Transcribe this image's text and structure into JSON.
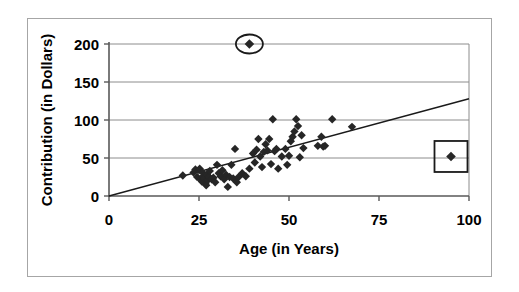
{
  "chart_data": {
    "type": "scatter",
    "title": "",
    "xlabel": "Age (in Years)",
    "ylabel": "Contribution (in Dollars)",
    "xlim": [
      0,
      100
    ],
    "ylim": [
      0,
      200
    ],
    "xticks": [
      "0",
      "25",
      "50",
      "75",
      "100"
    ],
    "xtick_values": [
      0,
      25,
      50,
      75,
      100
    ],
    "yticks": [
      "0",
      "50",
      "100",
      "150",
      "200"
    ],
    "ytick_values": [
      0,
      50,
      100,
      150,
      200
    ],
    "grid": "horizontal",
    "legend": "none",
    "marker": "diamond",
    "marker_color": "#262626",
    "series": [
      {
        "name": "Contributions",
        "points": [
          [
            20.5,
            27
          ],
          [
            23.5,
            31
          ],
          [
            24.0,
            35
          ],
          [
            24.5,
            25
          ],
          [
            25.0,
            34
          ],
          [
            25.2,
            36
          ],
          [
            25.5,
            22
          ],
          [
            25.8,
            19
          ],
          [
            26.0,
            31
          ],
          [
            26.2,
            26
          ],
          [
            26.5,
            23
          ],
          [
            26.8,
            16
          ],
          [
            27.0,
            14
          ],
          [
            27.2,
            28
          ],
          [
            27.5,
            21
          ],
          [
            27.8,
            25
          ],
          [
            28.0,
            33
          ],
          [
            28.5,
            22
          ],
          [
            29.0,
            24
          ],
          [
            29.5,
            18
          ],
          [
            30.0,
            41
          ],
          [
            30.5,
            30
          ],
          [
            31.0,
            26
          ],
          [
            31.5,
            34
          ],
          [
            32.0,
            22
          ],
          [
            32.5,
            28
          ],
          [
            33.0,
            12
          ],
          [
            33.5,
            25
          ],
          [
            34.0,
            41
          ],
          [
            34.5,
            23
          ],
          [
            35.0,
            62
          ],
          [
            35.5,
            18
          ],
          [
            36.0,
            25
          ],
          [
            37.0,
            30
          ],
          [
            38.0,
            26
          ],
          [
            39.0,
            36
          ],
          [
            40.0,
            56
          ],
          [
            40.5,
            44
          ],
          [
            41.0,
            61
          ],
          [
            41.5,
            75
          ],
          [
            42.0,
            52
          ],
          [
            42.5,
            38
          ],
          [
            43.0,
            58
          ],
          [
            43.5,
            68
          ],
          [
            44.0,
            60
          ],
          [
            44.5,
            75
          ],
          [
            45.0,
            42
          ],
          [
            45.5,
            101
          ],
          [
            46.0,
            59
          ],
          [
            46.5,
            62
          ],
          [
            47.0,
            36
          ],
          [
            48.0,
            52
          ],
          [
            49.0,
            62
          ],
          [
            49.5,
            41
          ],
          [
            50.0,
            53
          ],
          [
            50.5,
            72
          ],
          [
            51.0,
            78
          ],
          [
            51.5,
            85
          ],
          [
            52.0,
            101
          ],
          [
            52.5,
            92
          ],
          [
            53.0,
            51
          ],
          [
            53.5,
            80
          ],
          [
            54.0,
            63
          ],
          [
            58.0,
            66
          ],
          [
            59.0,
            78
          ],
          [
            59.5,
            65
          ],
          [
            60.0,
            66
          ],
          [
            62.0,
            101
          ],
          [
            67.5,
            91
          ]
        ]
      }
    ],
    "trendline": {
      "type": "linear",
      "x_start": 0,
      "y_start": 0,
      "x_end": 100,
      "y_end": 128
    },
    "annotations": [
      {
        "shape": "ellipse",
        "name": "circled-outlier",
        "x": 39,
        "y": 200,
        "label": ""
      },
      {
        "shape": "rectangle",
        "name": "boxed-outlier",
        "x": 95,
        "y": 52,
        "label": ""
      }
    ]
  },
  "colors": {
    "marker": "#262626",
    "axis": "#595959",
    "gridline": "#8c8c8c",
    "trendline": "#1a1a1a",
    "annotation": "#1a1a1a",
    "frame": "#a6a6a6",
    "text": "#000000"
  }
}
